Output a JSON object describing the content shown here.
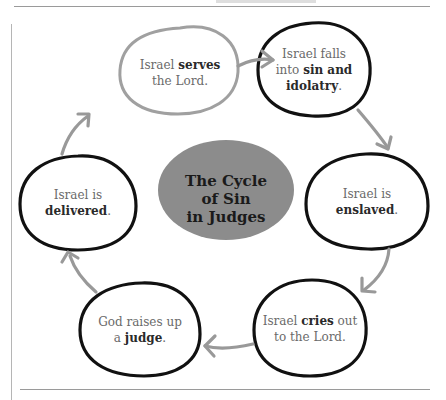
{
  "diagram": {
    "title_lines": [
      "The Cycle",
      "of Sin",
      "in Judges"
    ],
    "center_color": "#8c8c8c",
    "arrow_color": "#999999",
    "nodes": [
      {
        "id": "serves",
        "parts": [
          "Israel ",
          "serves",
          " the Lord."
        ],
        "line1_plain": "Israel ",
        "line1_bold": "serves",
        "line2_plain": "the Lord.",
        "outline": "gray"
      },
      {
        "id": "sin",
        "line1_plain": "Israel falls",
        "line2_plain": "into ",
        "line2_bold": "sin and",
        "line3_bold": "idolatry",
        "line3_plain": ".",
        "outline": "black"
      },
      {
        "id": "enslaved",
        "line1_plain": "Israel is",
        "line2_bold": "enslaved",
        "line2_plain": ".",
        "outline": "black"
      },
      {
        "id": "cries",
        "line1_plain": "Israel ",
        "line1_bold": "cries",
        "line1_tail": " out",
        "line2_plain": "to the Lord.",
        "outline": "black"
      },
      {
        "id": "judge",
        "line1_plain": "God raises up",
        "line2_plain": "a ",
        "line2_bold": "judge",
        "line2_tail": ".",
        "outline": "black"
      },
      {
        "id": "delivered",
        "line1_plain": "Israel is",
        "line2_bold": "delivered",
        "line2_plain": ".",
        "outline": "black"
      }
    ]
  }
}
